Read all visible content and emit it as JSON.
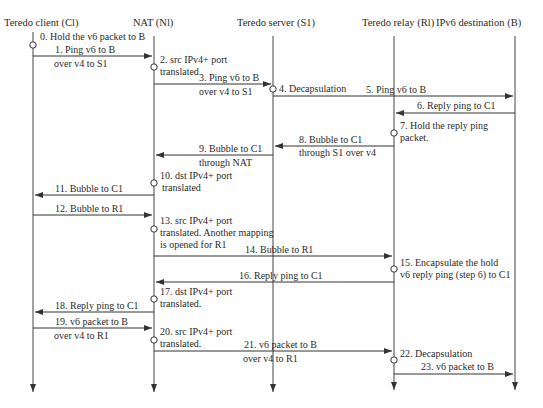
{
  "diagram": {
    "type": "sequence",
    "actors": [
      {
        "id": "C1",
        "label": "Teredo client (Cl)",
        "x": 33
      },
      {
        "id": "NAT",
        "label": "NAT  (Nl)",
        "x": 154
      },
      {
        "id": "S1",
        "label": "Teredo server (S1)",
        "x": 273
      },
      {
        "id": "R1",
        "label": "Teredo relay (Rl)",
        "x": 394
      },
      {
        "id": "B",
        "label": "IPv6 destination (B)",
        "x": 515
      }
    ],
    "steps": [
      {
        "n": "0",
        "text": [
          "0. Hold the v6 packet to B"
        ],
        "kind": "note",
        "at": "C1"
      },
      {
        "n": "1",
        "text": [
          "1. Ping v6 to B",
          "over v4 to S1"
        ],
        "kind": "msg",
        "from": "C1",
        "to": "NAT"
      },
      {
        "n": "2",
        "text": [
          "2. src IPv4+ port",
          "translated"
        ],
        "kind": "note",
        "at": "NAT"
      },
      {
        "n": "3",
        "text": [
          "3. Ping v6 to B",
          "over v4 to S1"
        ],
        "kind": "msg",
        "from": "NAT",
        "to": "S1"
      },
      {
        "n": "4",
        "text": [
          "4. Decapsulation"
        ],
        "kind": "note",
        "at": "S1"
      },
      {
        "n": "5",
        "text": [
          "5. Ping v6 to B"
        ],
        "kind": "msg",
        "from": "S1",
        "to": "B"
      },
      {
        "n": "6",
        "text": [
          "6. Reply ping to C1"
        ],
        "kind": "msg",
        "from": "B",
        "to": "R1"
      },
      {
        "n": "7",
        "text": [
          "7. Hold the reply ping",
          "packet."
        ],
        "kind": "note",
        "at": "R1"
      },
      {
        "n": "8",
        "text": [
          "8. Bubble to C1",
          "through S1 over v4"
        ],
        "kind": "msg",
        "from": "R1",
        "to": "S1"
      },
      {
        "n": "9",
        "text": [
          "9. Bubble to C1",
          "through NAT"
        ],
        "kind": "msg",
        "from": "S1",
        "to": "NAT"
      },
      {
        "n": "10",
        "text": [
          "10. dst IPv4+ port",
          "translated"
        ],
        "kind": "note",
        "at": "NAT"
      },
      {
        "n": "11",
        "text": [
          "11. Bubble to C1"
        ],
        "kind": "msg",
        "from": "NAT",
        "to": "C1"
      },
      {
        "n": "12",
        "text": [
          "12. Bubble to R1"
        ],
        "kind": "msg",
        "from": "C1",
        "to": "NAT"
      },
      {
        "n": "13",
        "text": [
          "13. src IPv4+ port",
          "translated. Another mapping",
          "is opened for R1"
        ],
        "kind": "note",
        "at": "NAT"
      },
      {
        "n": "14",
        "text": [
          "14. Bubble to R1"
        ],
        "kind": "msg",
        "from": "NAT",
        "to": "R1"
      },
      {
        "n": "15",
        "text": [
          "15. Encapsulate the hold",
          "v6 reply ping (step 6) to C1"
        ],
        "kind": "note",
        "at": "R1"
      },
      {
        "n": "16",
        "text": [
          "16. Reply ping to C1"
        ],
        "kind": "msg",
        "from": "R1",
        "to": "NAT"
      },
      {
        "n": "17",
        "text": [
          "17. dst IPv4+ port",
          "translated."
        ],
        "kind": "note",
        "at": "NAT"
      },
      {
        "n": "18",
        "text": [
          "18. Reply ping to C1"
        ],
        "kind": "msg",
        "from": "NAT",
        "to": "C1"
      },
      {
        "n": "19",
        "text": [
          "19. v6 packet to B",
          "over v4 to R1"
        ],
        "kind": "msg",
        "from": "C1",
        "to": "NAT"
      },
      {
        "n": "20",
        "text": [
          "20. src IPv4+ port",
          "translated."
        ],
        "kind": "note",
        "at": "NAT"
      },
      {
        "n": "21",
        "text": [
          "21. v6 packet to B",
          "over v4 to R1"
        ],
        "kind": "msg",
        "from": "NAT",
        "to": "R1"
      },
      {
        "n": "22",
        "text": [
          "22. Decapsulation"
        ],
        "kind": "note",
        "at": "R1"
      },
      {
        "n": "23",
        "text": [
          "23. v6 packet to B"
        ],
        "kind": "msg",
        "from": "R1",
        "to": "B"
      }
    ],
    "colors": {
      "line": "#333333",
      "text": "#2a2a2a",
      "background": "#ffffff"
    }
  }
}
